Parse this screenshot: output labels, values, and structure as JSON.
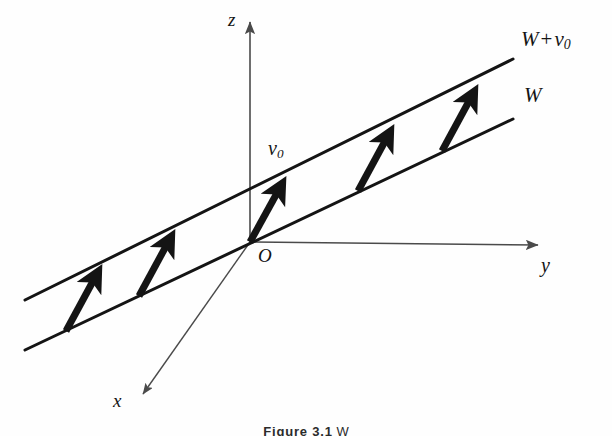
{
  "figure": {
    "domain": "diagram",
    "kind": "math-geometry-diagram",
    "background_color": "#fefefe",
    "ink_color": "#141414",
    "axis_color": "#4a4a4a",
    "width": 612,
    "height": 436
  },
  "labels": {
    "coset_line": "W",
    "coset_line_translated_prefix": "W",
    "coset_line_translated_operator": "+",
    "coset_line_translated_vector": "v",
    "coset_line_translated_vector_sub": "0",
    "vector_v0": "v",
    "vector_v0_sub": "0",
    "origin": "O",
    "axis_x": "x",
    "axis_y": "y",
    "axis_z": "z"
  },
  "caption": {
    "label": "Figure 3.1",
    "text": "W"
  },
  "geometry": {
    "origin": {
      "x": 250,
      "y": 242
    },
    "axes": [
      {
        "name": "z-axis",
        "from": {
          "x": 250,
          "y": 242
        },
        "to": {
          "x": 250,
          "y": 22
        },
        "arrow": "end"
      },
      {
        "name": "y-axis",
        "from": {
          "x": 250,
          "y": 242
        },
        "to": {
          "x": 541,
          "y": 245
        },
        "arrow": "end"
      },
      {
        "name": "x-axis",
        "from": {
          "x": 250,
          "y": 242
        },
        "to": {
          "x": 140,
          "y": 397
        },
        "arrow": "end"
      }
    ],
    "lines": [
      {
        "name": "W",
        "label": "W",
        "from": {
          "x": 25,
          "y": 350
        },
        "to": {
          "x": 513,
          "y": 119
        },
        "passes_through_origin": true
      },
      {
        "name": "W+v0",
        "label": "W + v0",
        "from": {
          "x": 25,
          "y": 300
        },
        "to": {
          "x": 513,
          "y": 59
        },
        "passes_through_origin": false
      }
    ],
    "vectors": [
      {
        "name": "vector-1",
        "from": {
          "x": 66,
          "y": 331
        },
        "to": {
          "x": 100,
          "y": 268
        }
      },
      {
        "name": "vector-2",
        "from": {
          "x": 139,
          "y": 296
        },
        "to": {
          "x": 173,
          "y": 233
        }
      },
      {
        "name": "vector-3",
        "from": {
          "x": 250,
          "y": 242
        },
        "to": {
          "x": 284,
          "y": 180
        }
      },
      {
        "name": "vector-4",
        "from": {
          "x": 358,
          "y": 191
        },
        "to": {
          "x": 392,
          "y": 128
        }
      },
      {
        "name": "vector-5",
        "from": {
          "x": 442,
          "y": 151
        },
        "to": {
          "x": 476,
          "y": 88
        }
      }
    ],
    "vector_line_width": 7,
    "coset_line_width": 3,
    "axis_line_width": 1.6
  }
}
